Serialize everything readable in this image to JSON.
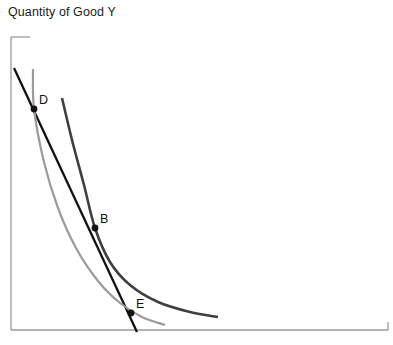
{
  "figure": {
    "axis_y_title": "Quantity of Good Y",
    "background_color": "#ffffff",
    "axis_color": "#9a9a9a"
  },
  "chart_data": {
    "type": "line",
    "title": "",
    "subtitle": "",
    "xlabel": "",
    "ylabel": "Quantity of Good Y",
    "grid": false,
    "legend_position": "none",
    "axis_frame": {
      "y_axis": {
        "x": 11,
        "y_top": 37,
        "y_bottom": 330
      },
      "x_axis": {
        "y": 330,
        "x_left": 11,
        "x_right": 388
      },
      "top_tick_x": 30,
      "right_tick_y": 322
    },
    "series": [
      {
        "name": "budget-line",
        "role": "budget line",
        "shape": "straight",
        "color": "#111111",
        "width": 2.3,
        "points": [
          [
            14,
            68
          ],
          [
            137,
            332
          ]
        ]
      },
      {
        "name": "indifference-curve-outer",
        "role": "higher indifference curve",
        "shape": "convex",
        "color": "#3f3f3f",
        "width": 2.6,
        "points": [
          [
            62,
            98
          ],
          [
            72,
            140
          ],
          [
            84,
            185
          ],
          [
            95,
            228
          ],
          [
            110,
            262
          ],
          [
            130,
            285
          ],
          [
            158,
            302
          ],
          [
            190,
            312
          ],
          [
            218,
            317
          ]
        ]
      },
      {
        "name": "indifference-curve-inner",
        "role": "lower indifference curve",
        "shape": "convex",
        "color": "#9b9b9b",
        "width": 2.2,
        "points": [
          [
            33,
            69
          ],
          [
            34,
            109
          ],
          [
            44,
            162
          ],
          [
            58,
            208
          ],
          [
            76,
            248
          ],
          [
            98,
            281
          ],
          [
            120,
            303
          ],
          [
            142,
            317
          ],
          [
            165,
            325
          ]
        ]
      }
    ],
    "points": [
      {
        "label": "D",
        "x": 34,
        "y": 109,
        "label_x": 39,
        "label_y": 93,
        "marker": "dot",
        "color": "#111111",
        "radius": 3.4
      },
      {
        "label": "B",
        "x": 95,
        "y": 228,
        "label_x": 100,
        "label_y": 212,
        "marker": "dot",
        "color": "#111111",
        "radius": 3.4
      },
      {
        "label": "E",
        "x": 131,
        "y": 313,
        "label_x": 136,
        "label_y": 297,
        "marker": "dot",
        "color": "#111111",
        "radius": 3.4
      }
    ]
  }
}
